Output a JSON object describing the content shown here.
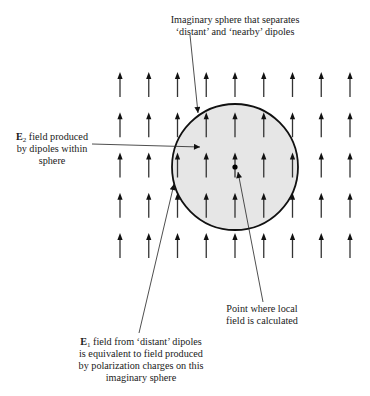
{
  "diagram": {
    "colors": {
      "ink": "#1a1a1a",
      "sphere_fill": "#e6e6e6",
      "sphere_stroke": "#111111",
      "dipole_arrow": "#333333",
      "background": "#ffffff"
    },
    "dipole_grid": {
      "columns": 9,
      "rows": 5,
      "x_start": 120,
      "x_step": 28.75,
      "y_tip_start": 72,
      "y_step": 40.25,
      "arrow_length": 25,
      "direction": "up"
    },
    "sphere": {
      "cx": 235,
      "cy": 167,
      "r": 63,
      "label": "Imaginary sphere"
    },
    "field_point": {
      "cx": 235,
      "cy": 167,
      "r": 2.6
    },
    "labels": {
      "sphere": {
        "lines": [
          "Imaginary sphere that separates",
          "‘distant’ and ‘nearby’ dipoles"
        ]
      },
      "e2": {
        "symbol": "E",
        "subscript": "2",
        "line1_rest": " field produced",
        "lines_rest": [
          "by dipoles within",
          "sphere"
        ]
      },
      "point": {
        "lines": [
          "Point where local",
          "field is calculated"
        ]
      },
      "e1": {
        "symbol": "E",
        "subscript": "1",
        "line1_rest": " field from ‘distant’ dipoles",
        "lines_rest": [
          "is equivalent to field produced",
          "by polarization charges on this",
          "imaginary sphere"
        ]
      }
    },
    "leaders": [
      {
        "name": "sphere-leader",
        "x1": 190,
        "y1": 35,
        "x2": 198,
        "y2": 113
      },
      {
        "name": "e2-leader",
        "x1": 92,
        "y1": 144,
        "x2": 200,
        "y2": 147
      },
      {
        "name": "e1-leader",
        "x1": 139,
        "y1": 333,
        "x2": 174,
        "y2": 184
      },
      {
        "name": "point-leader",
        "x1": 263,
        "y1": 302,
        "x2": 238,
        "y2": 172
      }
    ]
  }
}
